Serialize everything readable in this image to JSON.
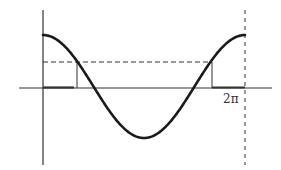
{
  "diagram": {
    "type": "cosine-wave-threshold",
    "function": "y = cos(x)",
    "domain": [
      0,
      "2π"
    ],
    "labels": {
      "x_end": "2π"
    },
    "threshold_fraction_of_amplitude": 0.5,
    "highlighted_intervals": [
      "[0, a]",
      "[2π - a, 2π]"
    ],
    "colors": {
      "curve": "#1a1a1a",
      "axis": "#333333",
      "dashed": "#333333",
      "background": "#ffffff"
    }
  }
}
